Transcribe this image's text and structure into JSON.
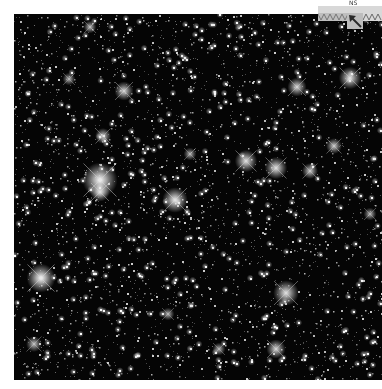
{
  "image": {
    "type": "astronomical-star-field",
    "background_color": "#050505",
    "frame_color": "#ffffff",
    "width": 368,
    "height": 366,
    "star_count": 3200,
    "seed": 4242,
    "bright_stars": [
      {
        "x": 86,
        "y": 166,
        "r": 11,
        "brightness": 1.0
      },
      {
        "x": 86,
        "y": 178,
        "r": 6,
        "brightness": 0.9
      },
      {
        "x": 161,
        "y": 186,
        "r": 8,
        "brightness": 0.95
      },
      {
        "x": 27,
        "y": 264,
        "r": 9,
        "brightness": 1.0
      },
      {
        "x": 262,
        "y": 335,
        "r": 6,
        "brightness": 0.85
      },
      {
        "x": 272,
        "y": 279,
        "r": 8,
        "brightness": 0.9
      },
      {
        "x": 232,
        "y": 147,
        "r": 7,
        "brightness": 0.9
      },
      {
        "x": 262,
        "y": 154,
        "r": 7,
        "brightness": 0.9
      },
      {
        "x": 296,
        "y": 157,
        "r": 5,
        "brightness": 0.8
      },
      {
        "x": 110,
        "y": 77,
        "r": 6,
        "brightness": 0.85
      },
      {
        "x": 336,
        "y": 64,
        "r": 7,
        "brightness": 0.9
      },
      {
        "x": 283,
        "y": 73,
        "r": 6,
        "brightness": 0.85
      },
      {
        "x": 89,
        "y": 122,
        "r": 5,
        "brightness": 0.8
      },
      {
        "x": 76,
        "y": 13,
        "r": 4,
        "brightness": 0.75
      },
      {
        "x": 320,
        "y": 132,
        "r": 5,
        "brightness": 0.8
      },
      {
        "x": 55,
        "y": 65,
        "r": 4,
        "brightness": 0.7
      },
      {
        "x": 176,
        "y": 140,
        "r": 4,
        "brightness": 0.7
      },
      {
        "x": 356,
        "y": 200,
        "r": 4,
        "brightness": 0.7
      },
      {
        "x": 205,
        "y": 335,
        "r": 4,
        "brightness": 0.7
      },
      {
        "x": 154,
        "y": 300,
        "r": 4,
        "brightness": 0.7
      },
      {
        "x": 20,
        "y": 330,
        "r": 5,
        "brightness": 0.75
      }
    ]
  },
  "overlay": {
    "orientation_label": "NS",
    "scale_bar_icon": "zigzag-scale-bar",
    "compass_icon": "northwest-arrow-icon",
    "scale_bar_color": "#d8d8d8",
    "compass_box_color": "#bdbdbd",
    "arrow_color": "#2a2a2a"
  }
}
